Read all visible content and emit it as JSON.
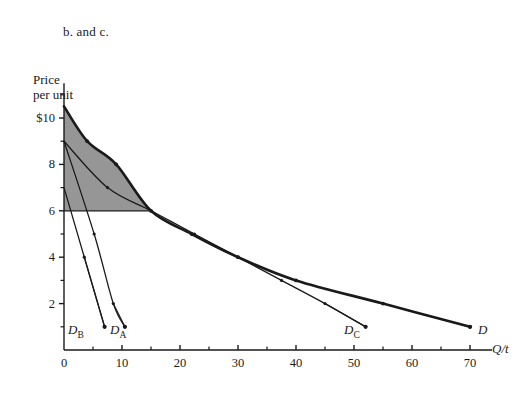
{
  "figure": {
    "title": "b. and c.",
    "y_axis_title_line1": "Price",
    "y_axis_title_line2": "per unit",
    "x_axis_title": "Q/t",
    "shade_color": "#969696",
    "curve_color": "#1a1a1a"
  },
  "axes": {
    "y_ticks": [
      {
        "value": 10,
        "label": "$10"
      },
      {
        "value": 8,
        "label": "8"
      },
      {
        "value": 6,
        "label": "6"
      },
      {
        "value": 4,
        "label": "4"
      },
      {
        "value": 2,
        "label": "2"
      }
    ],
    "y_minor_ticks": [
      1,
      3,
      5,
      7,
      9,
      11
    ],
    "x_ticks": [
      {
        "value": 0,
        "label": "0"
      },
      {
        "value": 10,
        "label": "10"
      },
      {
        "value": 20,
        "label": "20"
      },
      {
        "value": 30,
        "label": "30"
      },
      {
        "value": 40,
        "label": "40"
      },
      {
        "value": 50,
        "label": "50"
      },
      {
        "value": 60,
        "label": "60"
      },
      {
        "value": 70,
        "label": "70"
      }
    ],
    "x_minor_ticks": [
      5,
      15,
      25,
      35,
      45,
      55,
      65
    ],
    "xlim": [
      0,
      75
    ],
    "ylim": [
      0,
      11.5
    ]
  },
  "labels": {
    "d_b": "D",
    "d_b_sub": "B",
    "d_a": "D",
    "d_a_sub": "A",
    "d_c": "D",
    "d_c_sub": "C",
    "d": "D"
  },
  "chart_data": {
    "type": "line",
    "title": "b. and c.",
    "xlabel": "Q/t",
    "ylabel": "Price per unit",
    "xlim": [
      0,
      75
    ],
    "ylim": [
      0,
      11.5
    ],
    "grid": false,
    "legend": "inline-curve-labels",
    "shaded_region": {
      "label": "consumer surplus at price 6",
      "color": "#969696",
      "bounded_by": [
        "y-axis",
        "price line P=6",
        "demand curve D"
      ],
      "price_level": 6,
      "quantity_at_price": 15
    },
    "price_line": {
      "price": 6,
      "x_from": 0,
      "x_to": 15
    },
    "series": [
      {
        "name": "D_B",
        "style": "thin",
        "points": [
          [
            0,
            7
          ],
          [
            3.5,
            4
          ],
          [
            7,
            1
          ]
        ]
      },
      {
        "name": "D_A",
        "style": "thin",
        "points": [
          [
            0,
            9
          ],
          [
            5.2,
            5
          ],
          [
            8.5,
            2
          ],
          [
            10.5,
            1
          ]
        ]
      },
      {
        "name": "D_C",
        "style": "thin",
        "points": [
          [
            0,
            9
          ],
          [
            7.5,
            7
          ],
          [
            15,
            6
          ],
          [
            22.5,
            5
          ],
          [
            30,
            4
          ],
          [
            37.5,
            3
          ],
          [
            45,
            2
          ],
          [
            52,
            1
          ]
        ]
      },
      {
        "name": "D",
        "style": "thick",
        "points": [
          [
            0,
            10.5
          ],
          [
            4,
            9
          ],
          [
            9,
            8
          ],
          [
            15,
            6
          ],
          [
            22,
            5
          ],
          [
            30,
            4
          ],
          [
            40,
            3
          ],
          [
            55,
            2
          ],
          [
            70,
            1
          ]
        ]
      }
    ]
  }
}
